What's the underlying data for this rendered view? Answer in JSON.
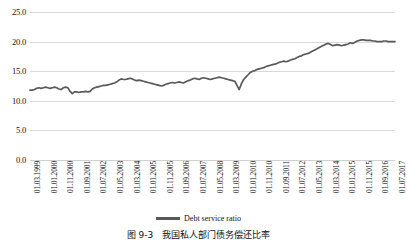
{
  "legend": {
    "series_label": "Debt service ratio",
    "line_color": "#595959"
  },
  "caption": {
    "text": "图 9-3　我国私人部门债务偿还比率"
  },
  "chart_data": {
    "type": "line",
    "title": "",
    "subtitle": "",
    "xlabel": "",
    "ylabel": "",
    "ylim": [
      0.0,
      25.0
    ],
    "yticks": [
      "0.0",
      "5.0",
      "10.0",
      "15.0",
      "20.0",
      "25.0"
    ],
    "ytick_values": [
      0.0,
      5.0,
      10.0,
      15.0,
      20.0,
      25.0
    ],
    "grid": true,
    "legend_position": "bottom-center",
    "xtick_labels": [
      "01.03.1999",
      "01.01.2000",
      "01.11.2000",
      "01.09.2001",
      "01.07.2002",
      "01.05.2003",
      "01.03.2004",
      "01.01.2005",
      "01.11.2005",
      "01.09.2006",
      "01.07.2007",
      "01.05.2008",
      "01.03.2009",
      "01.01.2010",
      "01.11.2010",
      "01.09.2011",
      "01.07.2012",
      "01.05.2013",
      "01.03.2014",
      "01.01.2015",
      "01.11.2015",
      "01.09.2016",
      "01.07.2017"
    ],
    "series": [
      {
        "name": "Debt service ratio",
        "color": "#595959",
        "values": [
          11.8,
          11.8,
          11.9,
          12.1,
          12.2,
          12.1,
          12.2,
          12.3,
          12.2,
          12.1,
          12.2,
          12.3,
          12.2,
          12.0,
          11.9,
          12.2,
          12.3,
          12.2,
          11.6,
          11.2,
          11.5,
          11.5,
          11.4,
          11.5,
          11.5,
          11.6,
          11.5,
          11.6,
          12.0,
          12.2,
          12.3,
          12.4,
          12.5,
          12.6,
          12.6,
          12.7,
          12.8,
          12.9,
          13.0,
          13.2,
          13.5,
          13.7,
          13.6,
          13.6,
          13.7,
          13.8,
          13.7,
          13.5,
          13.4,
          13.5,
          13.4,
          13.3,
          13.2,
          13.1,
          13.0,
          12.9,
          12.8,
          12.7,
          12.6,
          12.5,
          12.6,
          12.8,
          12.9,
          13.0,
          13.1,
          13.0,
          13.1,
          13.2,
          13.1,
          13.0,
          13.2,
          13.4,
          13.5,
          13.7,
          13.8,
          13.7,
          13.6,
          13.8,
          13.9,
          13.8,
          13.7,
          13.6,
          13.7,
          13.8,
          13.9,
          14.0,
          13.9,
          13.8,
          13.7,
          13.6,
          13.5,
          13.4,
          13.3,
          12.6,
          11.9,
          12.9,
          13.6,
          14.0,
          14.4,
          14.8,
          15.0,
          15.1,
          15.3,
          15.4,
          15.5,
          15.6,
          15.8,
          15.9,
          16.0,
          16.1,
          16.2,
          16.3,
          16.5,
          16.6,
          16.7,
          16.6,
          16.7,
          16.9,
          17.0,
          17.1,
          17.3,
          17.5,
          17.6,
          17.8,
          17.9,
          18.0,
          18.2,
          18.4,
          18.6,
          18.8,
          19.0,
          19.2,
          19.4,
          19.6,
          19.7,
          19.5,
          19.3,
          19.4,
          19.5,
          19.4,
          19.3,
          19.4,
          19.5,
          19.6,
          19.8,
          19.7,
          19.9,
          20.1,
          20.2,
          20.3,
          20.3,
          20.2,
          20.2,
          20.2,
          20.1,
          20.1,
          20.0,
          20.0,
          20.0,
          20.1,
          20.1,
          20.0,
          20.0,
          20.0,
          20.0
        ]
      }
    ]
  }
}
